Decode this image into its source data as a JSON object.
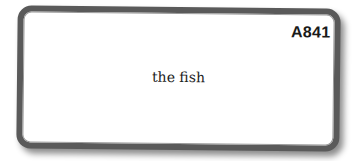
{
  "card": {
    "code": "A841",
    "text": "the fish",
    "border_color": "#5a5a5a"
  }
}
